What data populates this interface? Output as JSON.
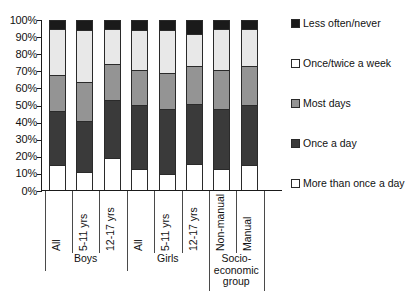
{
  "chart_data": {
    "type": "bar",
    "subtype": "stacked-bar-100-percent",
    "title": "",
    "xlabel": "",
    "ylabel": "",
    "ylim": [
      0,
      100
    ],
    "grid": false,
    "legend_position": "right",
    "y_ticks": [
      "0%",
      "10%",
      "20%",
      "30%",
      "40%",
      "50%",
      "60%",
      "70%",
      "80%",
      "90%",
      "100%"
    ],
    "y_tick_values": [
      0,
      10,
      20,
      30,
      40,
      50,
      60,
      70,
      80,
      90,
      100
    ],
    "categories": [
      "All",
      "5-11 yrs",
      "12-17 yrs",
      "All",
      "5-11 yrs",
      "12-17 yrs",
      "Non-manual",
      "Manual"
    ],
    "groups": [
      {
        "label": "Boys",
        "span": 3
      },
      {
        "label": "Girls",
        "span": 3
      },
      {
        "label": "Socio-economic group",
        "span": 2
      }
    ],
    "series": [
      {
        "name": "More than once a day",
        "color": "#ffffff",
        "values": [
          15,
          11,
          19,
          13,
          10,
          16,
          13,
          15
        ]
      },
      {
        "name": "Once a day",
        "color": "#3a3a3a",
        "values": [
          32,
          30,
          34,
          37,
          38,
          35,
          35,
          35
        ]
      },
      {
        "name": "Most days",
        "color": "#949494",
        "values": [
          21,
          23,
          21,
          21,
          21,
          22,
          23,
          23
        ]
      },
      {
        "name": "Once/twice a week",
        "color": "#e8e8e8",
        "values": [
          27,
          30,
          21,
          23,
          25,
          19,
          24,
          22
        ]
      },
      {
        "name": "Less often/never",
        "color": "#1a1a1a",
        "values": [
          5,
          6,
          5,
          6,
          6,
          8,
          5,
          5
        ]
      }
    ]
  },
  "legend": {
    "entries": [
      {
        "label": "Less often/never",
        "color": "#1a1a1a"
      },
      {
        "label": "Once/twice a week",
        "color": "#ffffff"
      },
      {
        "label": "Most days",
        "color": "#949494"
      },
      {
        "label": "Once a day",
        "color": "#3a3a3a"
      },
      {
        "label": "More than once a day",
        "color": "#ffffff"
      }
    ]
  },
  "group_labels": {
    "boys": "Boys",
    "girls": "Girls",
    "socio_line1": "Socio-",
    "socio_line2": "economic",
    "socio_line3": "group"
  }
}
